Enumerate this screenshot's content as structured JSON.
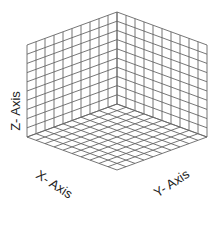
{
  "diagram": {
    "type": "isometric-3d-axes-grid",
    "labels": {
      "x_axis": "X- Axis",
      "y_axis": "Y- Axis",
      "z_axis": "Z- Axis"
    },
    "grid": {
      "divisions": 10,
      "line_color": "#666666",
      "background": "#ffffff"
    }
  }
}
